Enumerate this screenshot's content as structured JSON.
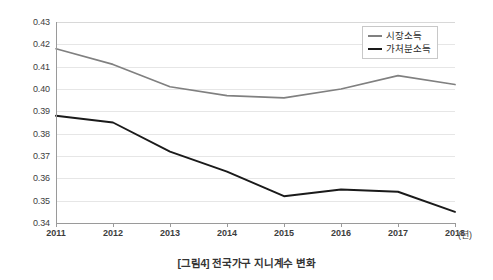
{
  "caption": "[그림4] 전국가구 지니계수 변화",
  "legend": {
    "position": "top-right",
    "entries": [
      {
        "label": "시장소득",
        "color": "#808080"
      },
      {
        "label": "가처분소득",
        "color": "#1a1a1a"
      }
    ]
  },
  "axis": {
    "x_unit_label": "(년)",
    "y_ticks": [
      "0.34",
      "0.35",
      "0.36",
      "0.37",
      "0.38",
      "0.39",
      "0.40",
      "0.41",
      "0.42",
      "0.43"
    ],
    "x_ticks": [
      "2011",
      "2012",
      "2013",
      "2014",
      "2015",
      "2016",
      "2017",
      "2018"
    ]
  },
  "chart_data": {
    "type": "line",
    "title": "[그림4] 전국가구 지니계수 변화",
    "xlabel": "(년)",
    "ylabel": "",
    "x": [
      2011,
      2012,
      2013,
      2014,
      2015,
      2016,
      2017,
      2018
    ],
    "categories": [
      "2011",
      "2012",
      "2013",
      "2014",
      "2015",
      "2016",
      "2017",
      "2018"
    ],
    "series": [
      {
        "name": "시장소득",
        "color": "#808080",
        "values": [
          0.418,
          0.411,
          0.401,
          0.397,
          0.396,
          0.4,
          0.406,
          0.402
        ]
      },
      {
        "name": "가처분소득",
        "color": "#1a1a1a",
        "values": [
          0.388,
          0.385,
          0.372,
          0.363,
          0.352,
          0.355,
          0.354,
          0.345
        ]
      }
    ],
    "ylim": [
      0.34,
      0.43
    ],
    "ytick_step": 0.01,
    "xlim": [
      2011,
      2018
    ],
    "grid": true,
    "grid_axis": "y",
    "legend_position": "top-right"
  }
}
